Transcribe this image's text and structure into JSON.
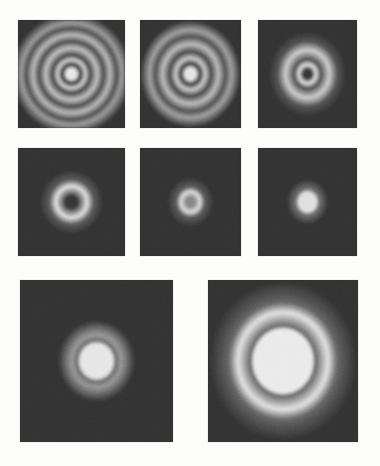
{
  "figure": {
    "background_color": "#fdfdfc",
    "panel_background_color": "#3c3c3c",
    "bright_color": "#f2f0ea",
    "dark_ring_color": "#2a2a2a"
  },
  "chart_data": {
    "type": "heatmap",
    "xlabel": "",
    "ylabel": "",
    "layout": {
      "rows": 3,
      "columns_per_row": [
        3,
        3,
        2
      ],
      "grid": false,
      "legend": "none"
    },
    "panels": [
      {
        "index": 1,
        "row": 1,
        "column": 1,
        "x": 18,
        "y": 20,
        "width": 107,
        "height": 108,
        "center_x": 0.5,
        "center_y": 0.5,
        "pattern": "concentric-rings",
        "ring_count": 4,
        "center_state": "bright-point",
        "rings": [
          {
            "radius_fraction": 0.045,
            "intensity": 0.94,
            "kind": "bright-core"
          },
          {
            "radius_fraction": 0.085,
            "intensity": 0.12,
            "kind": "dark"
          },
          {
            "radius_fraction": 0.13,
            "intensity": 0.8,
            "kind": "bright"
          },
          {
            "radius_fraction": 0.175,
            "intensity": 0.16,
            "kind": "dark"
          },
          {
            "radius_fraction": 0.24,
            "intensity": 0.74,
            "kind": "bright"
          },
          {
            "radius_fraction": 0.3,
            "intensity": 0.18,
            "kind": "dark"
          },
          {
            "radius_fraction": 0.36,
            "intensity": 0.7,
            "kind": "bright"
          },
          {
            "radius_fraction": 0.42,
            "intensity": 0.2,
            "kind": "dark"
          },
          {
            "radius_fraction": 0.47,
            "intensity": 0.55,
            "kind": "bright"
          }
        ]
      },
      {
        "index": 2,
        "row": 1,
        "column": 2,
        "x": 140,
        "y": 20,
        "width": 101,
        "height": 108,
        "center_x": 0.5,
        "center_y": 0.5,
        "pattern": "concentric-rings",
        "ring_count": 3,
        "center_state": "bright-point",
        "rings": [
          {
            "radius_fraction": 0.05,
            "intensity": 0.92,
            "kind": "bright-core"
          },
          {
            "radius_fraction": 0.095,
            "intensity": 0.12,
            "kind": "dark"
          },
          {
            "radius_fraction": 0.145,
            "intensity": 0.78,
            "kind": "bright"
          },
          {
            "radius_fraction": 0.205,
            "intensity": 0.16,
            "kind": "dark"
          },
          {
            "radius_fraction": 0.275,
            "intensity": 0.72,
            "kind": "bright"
          },
          {
            "radius_fraction": 0.345,
            "intensity": 0.2,
            "kind": "dark"
          },
          {
            "radius_fraction": 0.405,
            "intensity": 0.58,
            "kind": "bright"
          }
        ]
      },
      {
        "index": 3,
        "row": 1,
        "column": 3,
        "x": 258,
        "y": 20,
        "width": 99,
        "height": 108,
        "center_x": 0.5,
        "center_y": 0.5,
        "pattern": "concentric-rings",
        "ring_count": 2,
        "center_state": "dark-point",
        "rings": [
          {
            "radius_fraction": 0.04,
            "intensity": 0.08,
            "kind": "dark-core"
          },
          {
            "radius_fraction": 0.085,
            "intensity": 0.88,
            "kind": "bright"
          },
          {
            "radius_fraction": 0.135,
            "intensity": 0.2,
            "kind": "dark"
          },
          {
            "radius_fraction": 0.22,
            "intensity": 0.8,
            "kind": "bright"
          },
          {
            "radius_fraction": 0.3,
            "intensity": 0.22,
            "kind": "dark"
          }
        ]
      },
      {
        "index": 4,
        "row": 2,
        "column": 1,
        "x": 18,
        "y": 148,
        "width": 107,
        "height": 108,
        "center_x": 0.5,
        "center_y": 0.5,
        "pattern": "annulus",
        "ring_count": 1,
        "center_state": "dark-hole",
        "rings": [
          {
            "radius_fraction": 0.055,
            "intensity": 0.07,
            "kind": "dark-core"
          },
          {
            "radius_fraction": 0.145,
            "intensity": 0.9,
            "kind": "bright"
          },
          {
            "radius_fraction": 0.205,
            "intensity": 0.25,
            "kind": "dark"
          }
        ]
      },
      {
        "index": 5,
        "row": 2,
        "column": 2,
        "x": 140,
        "y": 148,
        "width": 101,
        "height": 108,
        "center_x": 0.5,
        "center_y": 0.5,
        "pattern": "small-annulus",
        "ring_count": 1,
        "center_state": "dim-core",
        "rings": [
          {
            "radius_fraction": 0.04,
            "intensity": 0.45,
            "kind": "dim-core"
          },
          {
            "radius_fraction": 0.095,
            "intensity": 0.88,
            "kind": "bright"
          },
          {
            "radius_fraction": 0.14,
            "intensity": 0.25,
            "kind": "dark"
          }
        ]
      },
      {
        "index": 6,
        "row": 2,
        "column": 3,
        "x": 258,
        "y": 148,
        "width": 99,
        "height": 108,
        "center_x": 0.5,
        "center_y": 0.5,
        "pattern": "solid-disk",
        "ring_count": 0,
        "center_state": "bright-disk",
        "rings": [
          {
            "radius_fraction": 0.085,
            "intensity": 0.9,
            "kind": "bright-core"
          },
          {
            "radius_fraction": 0.12,
            "intensity": 0.35,
            "kind": "halo"
          }
        ]
      },
      {
        "index": 7,
        "row": 3,
        "column": 1,
        "x": 20,
        "y": 280,
        "width": 153,
        "height": 162,
        "center_x": 0.5,
        "center_y": 0.5,
        "pattern": "disk-with-halo",
        "ring_count": 1,
        "center_state": "bright-disk",
        "rings": [
          {
            "radius_fraction": 0.105,
            "intensity": 0.93,
            "kind": "bright-core"
          },
          {
            "radius_fraction": 0.125,
            "intensity": 0.3,
            "kind": "dark"
          },
          {
            "radius_fraction": 0.16,
            "intensity": 0.55,
            "kind": "halo"
          }
        ]
      },
      {
        "index": 8,
        "row": 3,
        "column": 2,
        "x": 208,
        "y": 280,
        "width": 150,
        "height": 162,
        "center_x": 0.5,
        "center_y": 0.5,
        "pattern": "disk-with-bright-annulus",
        "ring_count": 2,
        "center_state": "bright-disk",
        "rings": [
          {
            "radius_fraction": 0.195,
            "intensity": 0.95,
            "kind": "bright-core"
          },
          {
            "radius_fraction": 0.215,
            "intensity": 0.28,
            "kind": "dark"
          },
          {
            "radius_fraction": 0.3,
            "intensity": 0.92,
            "kind": "bright"
          },
          {
            "radius_fraction": 0.36,
            "intensity": 0.3,
            "kind": "dark"
          },
          {
            "radius_fraction": 0.4,
            "intensity": 0.22,
            "kind": "faint-halo"
          }
        ]
      }
    ]
  }
}
